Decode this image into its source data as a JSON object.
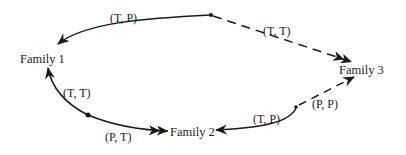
{
  "diagram": {
    "nodes": [
      {
        "id": "family1",
        "label": "Family 1"
      },
      {
        "id": "family2",
        "label": "Family 2"
      },
      {
        "id": "family3",
        "label": "Family 3"
      }
    ],
    "edges": [
      {
        "from": "split_top",
        "to": "family1",
        "label": "(T, P)",
        "style": "solid"
      },
      {
        "from": "split_top",
        "to": "family3",
        "label": "(T, T)",
        "style": "dashed"
      },
      {
        "from": "split_left",
        "to": "family1",
        "label": "(T, T)",
        "style": "solid"
      },
      {
        "from": "split_left",
        "to": "family2",
        "label": "(P, T)",
        "style": "solid"
      },
      {
        "from": "split_right",
        "to": "family2",
        "label": "(T, P)",
        "style": "solid"
      },
      {
        "from": "split_right",
        "to": "family3",
        "label": "(P, P)",
        "style": "dashed"
      }
    ]
  },
  "colors": {
    "line": "#1a1a1a",
    "text": "#222222",
    "background": "#ffffff"
  }
}
